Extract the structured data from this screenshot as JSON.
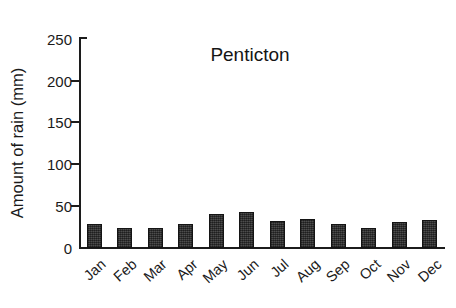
{
  "chart_data": {
    "type": "bar",
    "title": "Penticton",
    "xlabel": "",
    "ylabel": "Amount of rain (mm)",
    "categories": [
      "Jan",
      "Feb",
      "Mar",
      "Apr",
      "May",
      "Jun",
      "Jul",
      "Aug",
      "Sep",
      "Oct",
      "Nov",
      "Dec"
    ],
    "values": [
      28,
      24,
      24,
      29,
      40,
      43,
      32,
      35,
      29,
      24,
      31,
      33
    ],
    "ylim": [
      0,
      250
    ],
    "yticks": [
      0,
      50,
      100,
      150,
      200,
      250
    ],
    "ytick_labels": [
      "0",
      "50",
      "100",
      "150",
      "200",
      "250"
    ],
    "grid": false,
    "legend": false,
    "legend_position": "none",
    "series": [
      {
        "name": "Amount of rain (mm)",
        "values": [
          28,
          24,
          24,
          29,
          40,
          43,
          32,
          35,
          29,
          24,
          31,
          33
        ]
      }
    ],
    "colors": {
      "bar_fill": "#3b3b3b",
      "bar_edge": "#141414",
      "axis": "#1c1c1c",
      "text": "#1a1a1a",
      "background": "#ffffff"
    }
  }
}
